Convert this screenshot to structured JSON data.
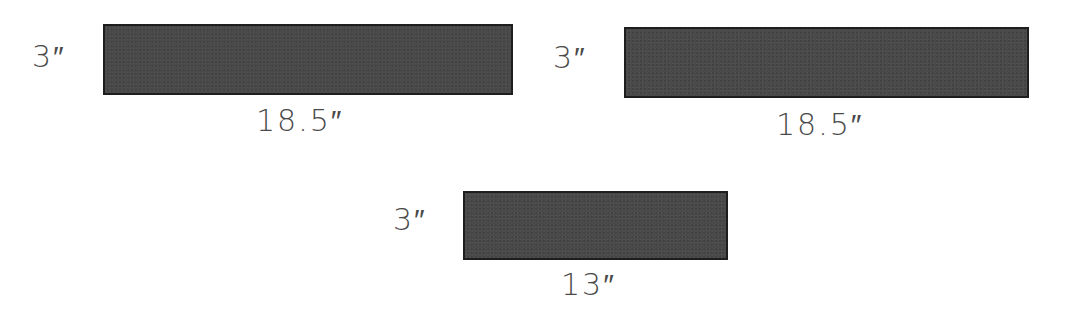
{
  "board_pieces": [
    {
      "height_label": "3″",
      "width_label": "18.5″",
      "height_in": 3,
      "width_in": 18.5
    },
    {
      "height_label": "3″",
      "width_label": "18.5″",
      "height_in": 3,
      "width_in": 18.5
    },
    {
      "height_label": "3″",
      "width_label": "13″",
      "height_in": 3,
      "width_in": 13
    }
  ],
  "colors": {
    "fill": "#4a4a4a",
    "border": "#1e1e1e",
    "text": "#4a4a4a"
  }
}
